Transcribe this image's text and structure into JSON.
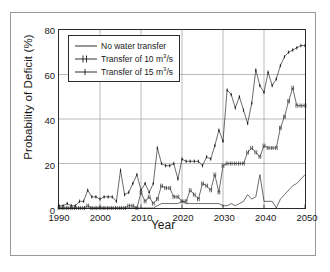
{
  "chart_data": {
    "type": "line",
    "title": "",
    "xlabel": "Year",
    "ylabel": "Probability of Deficit (%)",
    "xlim": [
      1990,
      2050
    ],
    "ylim": [
      0,
      80
    ],
    "xticks": [
      1990,
      2000,
      2010,
      2020,
      2030,
      2040,
      2050
    ],
    "yticks": [
      0,
      20,
      40,
      60,
      80
    ],
    "grid": true,
    "legend_position": "top-left",
    "x": [
      1990,
      1991,
      1992,
      1993,
      1994,
      1995,
      1996,
      1997,
      1998,
      1999,
      2000,
      2001,
      2002,
      2003,
      2004,
      2005,
      2006,
      2007,
      2008,
      2009,
      2010,
      2011,
      2012,
      2013,
      2014,
      2015,
      2016,
      2017,
      2018,
      2019,
      2020,
      2021,
      2022,
      2023,
      2024,
      2025,
      2026,
      2027,
      2028,
      2029,
      2030,
      2031,
      2032,
      2033,
      2034,
      2035,
      2036,
      2037,
      2038,
      2039,
      2040,
      2041,
      2042,
      2043,
      2044,
      2045,
      2046,
      2047,
      2048,
      2049,
      2050
    ],
    "series": [
      {
        "name": "No water transfer",
        "marker": "none",
        "values": [
          0,
          0,
          0,
          0,
          0,
          0,
          0,
          0,
          0,
          0,
          0,
          0,
          0,
          0,
          0,
          0,
          0,
          0,
          0,
          0,
          0,
          0,
          0,
          0,
          1,
          2,
          2,
          2,
          2,
          2,
          3,
          2,
          2,
          2,
          2,
          2,
          2,
          2,
          2,
          2,
          1,
          1,
          2,
          1,
          2,
          3,
          6,
          4,
          5,
          15,
          3,
          3,
          3,
          0,
          4,
          6,
          8,
          10,
          11,
          13,
          15
        ]
      },
      {
        "name": "Transfer of 10 m³/s",
        "marker": "cross-bar",
        "values": [
          0,
          0,
          0,
          0,
          0,
          0,
          0,
          1,
          0,
          0,
          0,
          0,
          0,
          0,
          0,
          0,
          0,
          1,
          1,
          0,
          7,
          3,
          5,
          2,
          4,
          10,
          9,
          9,
          5,
          5,
          3,
          3,
          8,
          6,
          4,
          11,
          10,
          8,
          15,
          7,
          19,
          20,
          20,
          20,
          20,
          20,
          25,
          27,
          25,
          23,
          28,
          27,
          27,
          27,
          36,
          41,
          48,
          54,
          46,
          46,
          46
        ]
      },
      {
        "name": "Transfer of 15 m³/s",
        "marker": "cross",
        "values": [
          1,
          1,
          2,
          1,
          1,
          3,
          3,
          8,
          5,
          5,
          4,
          5,
          5,
          5,
          3,
          17,
          6,
          7,
          11,
          15,
          8,
          11,
          7,
          11,
          27,
          20,
          19,
          19,
          20,
          13,
          22,
          21,
          21,
          21,
          21,
          19,
          23,
          22,
          28,
          35,
          30,
          53,
          51,
          45,
          50,
          44,
          38,
          47,
          62,
          55,
          52,
          61,
          55,
          58,
          64,
          68,
          70,
          71,
          72,
          73,
          73
        ]
      }
    ]
  },
  "figure": {
    "ylabel_text": "Probability of Deficit (%)",
    "xlabel_text": "Year",
    "ytick_labels": [
      "0",
      "20",
      "40",
      "60",
      "80"
    ],
    "xtick_labels": [
      "1990",
      "2000",
      "2010",
      "2020",
      "2030",
      "2040",
      "2050"
    ]
  },
  "legend": {
    "items": [
      {
        "label": "No water transfer",
        "unit": "",
        "sup": ""
      },
      {
        "label_pre": "Transfer of 10 m",
        "sup": "3",
        "label_post": "/s"
      },
      {
        "label_pre": "Transfer of 15 m",
        "sup": "3",
        "label_post": "/s"
      }
    ],
    "row1": "No water transfer",
    "row2_pre": "Transfer of 10 m",
    "row2_sup": "3",
    "row2_post": "/s",
    "row3_pre": "Transfer of 15 m",
    "row3_sup": "3",
    "row3_post": "/s"
  },
  "colors": {
    "line": "#1a1a1a",
    "grid": "#8c8c8c",
    "axis": "#2a2a2a",
    "frame": "#9a9a9a",
    "background": "#ffffff"
  }
}
